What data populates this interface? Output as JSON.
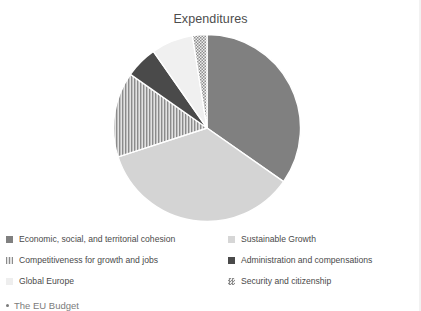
{
  "chart_data": {
    "type": "pie",
    "title": "Expenditures",
    "xlabel": "",
    "ylabel": "",
    "legend_position": "bottom",
    "grid": false,
    "start_angle_deg": 0,
    "direction": "clockwise",
    "categories": [
      "Economic, social, and territorial cohesion",
      "Sustainable Growth",
      "Competitiveness for growth and jobs",
      "Administration and compensations",
      "Global Europe",
      "Security and citizenship"
    ],
    "values": [
      34.7,
      35.3,
      14.7,
      5.6,
      7.2,
      2.5
    ],
    "slices": [
      {
        "label": "Economic, social, and territorial cohesion",
        "value": 34.7,
        "start_deg": 0,
        "end_deg": 125,
        "fill": "#808080",
        "pattern": "solid"
      },
      {
        "label": "Sustainable Growth",
        "value": 35.3,
        "start_deg": 125,
        "end_deg": 252,
        "fill": "#d4d4d4",
        "pattern": "solid"
      },
      {
        "label": "Competitiveness for growth and jobs",
        "value": 14.7,
        "start_deg": 252,
        "end_deg": 305,
        "fill": "#9a9a9a",
        "pattern": "vertical-stripes"
      },
      {
        "label": "Administration and compensations",
        "value": 5.6,
        "start_deg": 305,
        "end_deg": 325,
        "fill": "#4a4a4a",
        "pattern": "solid"
      },
      {
        "label": "Global Europe",
        "value": 7.2,
        "start_deg": 325,
        "end_deg": 351,
        "fill": "#f0f0f0",
        "pattern": "solid"
      },
      {
        "label": "Security and citizenship",
        "value": 2.5,
        "start_deg": 351,
        "end_deg": 360,
        "fill": "#a8a8a8",
        "pattern": "checker"
      }
    ]
  },
  "legend": {
    "left_column": [
      {
        "label": "Economic, social, and territorial cohesion",
        "swatch": "#808080",
        "pattern": "solid"
      },
      {
        "label": "Competitiveness for growth and jobs",
        "swatch": "#9a9a9a",
        "pattern": "vertical-stripes"
      },
      {
        "label": "Global Europe",
        "swatch": "#eeeeee",
        "pattern": "solid"
      }
    ],
    "right_column": [
      {
        "label": "Sustainable Growth",
        "swatch": "#d6d6d6",
        "pattern": "solid"
      },
      {
        "label": "Administration and compensations",
        "swatch": "#4a4a4a",
        "pattern": "solid"
      },
      {
        "label": "Security and citizenship",
        "swatch": "#8f8f8f",
        "pattern": "checker"
      }
    ]
  },
  "footer": {
    "bullet_text": "The EU Budget"
  }
}
